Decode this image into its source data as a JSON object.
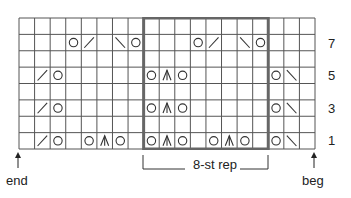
{
  "chart": {
    "columns": 19,
    "rows": 8,
    "repeat": {
      "start_col": 8,
      "end_col": 16,
      "label": "8-st rep"
    },
    "row_labels": [
      {
        "row": 7,
        "label": "7"
      },
      {
        "row": 5,
        "label": "5"
      },
      {
        "row": 3,
        "label": "3"
      },
      {
        "row": 1,
        "label": "1"
      }
    ],
    "legend_symbols": {
      "O": "yarn-over",
      "/": "k2tog",
      "\\": "ssk",
      "A": "centered double decrease"
    },
    "grid": [
      [
        "",
        "",
        "",
        "",
        "",
        "",
        "",
        "",
        "",
        "",
        "",
        "",
        "",
        "",
        "",
        "",
        "",
        "",
        ""
      ],
      [
        "",
        "",
        "",
        "O",
        "/",
        "",
        "\\",
        "O",
        "",
        "",
        "",
        "O",
        "/",
        "",
        "\\",
        "O",
        "",
        "",
        ""
      ],
      [
        "",
        "",
        "",
        "",
        "",
        "",
        "",
        "",
        "",
        "",
        "",
        "",
        "",
        "",
        "",
        "",
        "",
        "",
        ""
      ],
      [
        "",
        "/",
        "O",
        "",
        "",
        "",
        "",
        "",
        "O",
        "A",
        "O",
        "",
        "",
        "",
        "",
        "",
        "O",
        "\\",
        ""
      ],
      [
        "",
        "",
        "",
        "",
        "",
        "",
        "",
        "",
        "",
        "",
        "",
        "",
        "",
        "",
        "",
        "",
        "",
        "",
        ""
      ],
      [
        "",
        "/",
        "O",
        "",
        "",
        "",
        "",
        "",
        "O",
        "A",
        "O",
        "",
        "",
        "",
        "",
        "",
        "O",
        "\\",
        ""
      ],
      [
        "",
        "",
        "",
        "",
        "",
        "",
        "",
        "",
        "",
        "",
        "",
        "",
        "",
        "",
        "",
        "",
        "",
        "",
        ""
      ],
      [
        "",
        "/",
        "O",
        "",
        "O",
        "A",
        "O",
        "",
        "O",
        "A",
        "O",
        "",
        "O",
        "A",
        "O",
        "",
        "O",
        "\\",
        ""
      ]
    ],
    "colors": {
      "grid_line": "#555555",
      "repeat_border": "#666666",
      "symbol": "#333333"
    }
  },
  "labels": {
    "end": "end",
    "beg": "beg",
    "rep": "8-st rep",
    "row7": "7",
    "row5": "5",
    "row3": "3",
    "row1": "1"
  }
}
